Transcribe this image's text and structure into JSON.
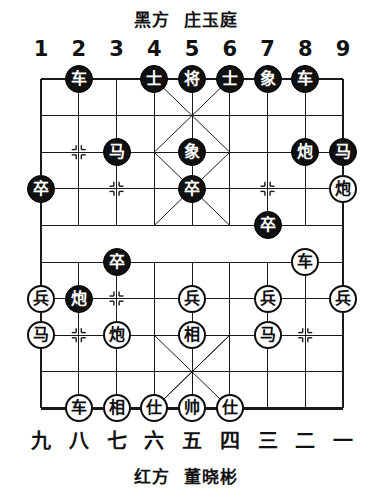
{
  "header": {
    "black_side_label": "黑方",
    "black_player": "庄玉庭"
  },
  "footer": {
    "red_side_label": "红方",
    "red_player": "董晓彬"
  },
  "files": {
    "top": [
      "1",
      "2",
      "3",
      "4",
      "5",
      "6",
      "7",
      "8",
      "9"
    ],
    "bottom": [
      "九",
      "八",
      "七",
      "六",
      "五",
      "四",
      "三",
      "二",
      "一"
    ]
  },
  "board": {
    "columns": 9,
    "rows": 10,
    "left": 41,
    "top": 19,
    "col_spacing": 37.75,
    "row_spacing": 36.6,
    "river_top_row": 4,
    "river_bottom_row": 5,
    "line_color": "#1a1a1a",
    "black_piece_color": "#101010",
    "red_piece_color": "#ffffff",
    "markers": [
      {
        "col": 2,
        "row": 2
      },
      {
        "col": 3,
        "row": 3
      },
      {
        "col": 7,
        "row": 3
      },
      {
        "col": 3,
        "row": 6
      },
      {
        "col": 2,
        "row": 7
      },
      {
        "col": 8,
        "row": 7
      }
    ],
    "pieces": [
      {
        "col": 2,
        "row": 0,
        "side": "black",
        "label": "车",
        "name": "chariot"
      },
      {
        "col": 4,
        "row": 0,
        "side": "black",
        "label": "士",
        "name": "advisor"
      },
      {
        "col": 5,
        "row": 0,
        "side": "black",
        "label": "将",
        "name": "general"
      },
      {
        "col": 6,
        "row": 0,
        "side": "black",
        "label": "士",
        "name": "advisor"
      },
      {
        "col": 7,
        "row": 0,
        "side": "black",
        "label": "象",
        "name": "elephant"
      },
      {
        "col": 8,
        "row": 0,
        "side": "black",
        "label": "车",
        "name": "chariot"
      },
      {
        "col": 3,
        "row": 2,
        "side": "black",
        "label": "马",
        "name": "horse"
      },
      {
        "col": 5,
        "row": 2,
        "side": "black",
        "label": "象",
        "name": "elephant"
      },
      {
        "col": 8,
        "row": 2,
        "side": "black",
        "label": "炮",
        "name": "cannon"
      },
      {
        "col": 9,
        "row": 2,
        "side": "black",
        "label": "马",
        "name": "horse"
      },
      {
        "col": 1,
        "row": 3,
        "side": "black",
        "label": "卒",
        "name": "pawn"
      },
      {
        "col": 5,
        "row": 3,
        "side": "black",
        "label": "卒",
        "name": "pawn"
      },
      {
        "col": 9,
        "row": 3,
        "side": "red",
        "label": "炮",
        "name": "cannon"
      },
      {
        "col": 7,
        "row": 4,
        "side": "black",
        "label": "卒",
        "name": "pawn"
      },
      {
        "col": 3,
        "row": 5,
        "side": "black",
        "label": "卒",
        "name": "pawn"
      },
      {
        "col": 8,
        "row": 5,
        "side": "red",
        "label": "车",
        "name": "chariot"
      },
      {
        "col": 1,
        "row": 6,
        "side": "red",
        "label": "兵",
        "name": "pawn"
      },
      {
        "col": 2,
        "row": 6,
        "side": "black",
        "label": "炮",
        "name": "cannon"
      },
      {
        "col": 5,
        "row": 6,
        "side": "red",
        "label": "兵",
        "name": "pawn"
      },
      {
        "col": 7,
        "row": 6,
        "side": "red",
        "label": "兵",
        "name": "pawn"
      },
      {
        "col": 9,
        "row": 6,
        "side": "red",
        "label": "兵",
        "name": "pawn"
      },
      {
        "col": 1,
        "row": 7,
        "side": "red",
        "label": "马",
        "name": "horse"
      },
      {
        "col": 3,
        "row": 7,
        "side": "red",
        "label": "炮",
        "name": "cannon"
      },
      {
        "col": 5,
        "row": 7,
        "side": "red",
        "label": "相",
        "name": "elephant"
      },
      {
        "col": 7,
        "row": 7,
        "side": "red",
        "label": "马",
        "name": "horse"
      },
      {
        "col": 2,
        "row": 9,
        "side": "red",
        "label": "车",
        "name": "chariot"
      },
      {
        "col": 3,
        "row": 9,
        "side": "red",
        "label": "相",
        "name": "elephant"
      },
      {
        "col": 4,
        "row": 9,
        "side": "red",
        "label": "仕",
        "name": "advisor"
      },
      {
        "col": 5,
        "row": 9,
        "side": "red",
        "label": "帅",
        "name": "general"
      },
      {
        "col": 6,
        "row": 9,
        "side": "red",
        "label": "仕",
        "name": "advisor"
      }
    ]
  }
}
